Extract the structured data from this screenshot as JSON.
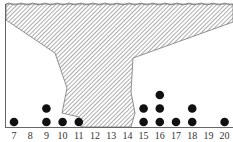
{
  "chart_data": {
    "type": "scatter",
    "subtype": "dot_plot",
    "title": "",
    "xlabel": "",
    "ylabel": "",
    "x_ticks": [
      7,
      8,
      9,
      10,
      11,
      12,
      13,
      14,
      15,
      16,
      17,
      18,
      19,
      20
    ],
    "xlim": [
      7,
      20
    ],
    "grid": false,
    "legend": null,
    "points": [
      {
        "x": 7,
        "count": 1
      },
      {
        "x": 9,
        "count": 2
      },
      {
        "x": 10,
        "count": 1
      },
      {
        "x": 11,
        "count": 1
      },
      {
        "x": 15,
        "count": 2
      },
      {
        "x": 16,
        "count": 3
      },
      {
        "x": 17,
        "count": 1
      },
      {
        "x": 18,
        "count": 2
      },
      {
        "x": 20,
        "count": 1
      }
    ],
    "annotations": [
      "Hatched region covering values roughly 12 to 14 and upper portion of plot (hidden data)"
    ]
  },
  "colors": {
    "dot": "#111111",
    "hatch": "#888888",
    "axis": "#666666",
    "text": "#333333"
  }
}
